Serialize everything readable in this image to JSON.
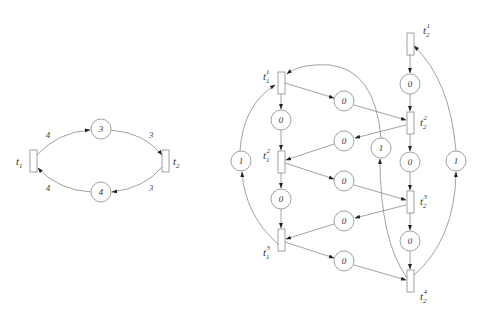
{
  "left_net": {
    "transitions": [
      {
        "id": "t1",
        "label": "t",
        "sub": "1",
        "sup": ""
      },
      {
        "id": "t2",
        "label": "t",
        "sub": "2",
        "sup": ""
      }
    ],
    "places": [
      {
        "id": "p_top",
        "tokens": "3"
      },
      {
        "id": "p_bottom",
        "tokens": "4"
      }
    ],
    "weights": {
      "t1_to_ptop": "4",
      "ptop_to_t2": "3",
      "t2_to_pbottom": "3",
      "pbottom_to_t1": "4"
    }
  },
  "right_net": {
    "transitions": [
      {
        "id": "t1_1",
        "label": "t",
        "sub": "1",
        "sup": "1"
      },
      {
        "id": "t1_2",
        "label": "t",
        "sub": "1",
        "sup": "2"
      },
      {
        "id": "t1_3",
        "label": "t",
        "sub": "1",
        "sup": "3"
      },
      {
        "id": "t2_1",
        "label": "t",
        "sub": "2",
        "sup": "1"
      },
      {
        "id": "t2_2",
        "label": "t",
        "sub": "2",
        "sup": "2"
      },
      {
        "id": "t2_3",
        "label": "t",
        "sub": "2",
        "sup": "3"
      },
      {
        "id": "t2_4",
        "label": "t",
        "sub": "2",
        "sup": "4"
      }
    ],
    "places": [
      {
        "id": "pa1",
        "tokens": "0"
      },
      {
        "id": "pa2",
        "tokens": "0"
      },
      {
        "id": "pm1",
        "tokens": "0"
      },
      {
        "id": "pm2",
        "tokens": "0"
      },
      {
        "id": "pm3",
        "tokens": "0"
      },
      {
        "id": "pm4",
        "tokens": "0"
      },
      {
        "id": "pm5",
        "tokens": "0"
      },
      {
        "id": "pb1",
        "tokens": "0"
      },
      {
        "id": "pb2",
        "tokens": "0"
      },
      {
        "id": "pb3",
        "tokens": "0"
      },
      {
        "id": "pl",
        "tokens": "1"
      },
      {
        "id": "pc",
        "tokens": "1"
      },
      {
        "id": "pr",
        "tokens": "1"
      }
    ]
  }
}
